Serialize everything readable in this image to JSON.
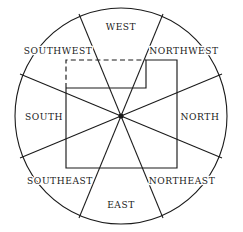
{
  "figure": {
    "background_color": "#ffffff",
    "line_color": "#1a1a1a"
  },
  "compass": {
    "center": {
      "x": 121,
      "y": 116
    },
    "radius_x": 106,
    "radius_y": 108,
    "sector_count": 8,
    "labels": [
      {
        "name": "west",
        "text": "WEST",
        "x": 121,
        "y": 27,
        "angle_deg": 270
      },
      {
        "name": "northwest",
        "text": "NORTHWEST",
        "x": 184,
        "y": 51,
        "angle_deg": 315
      },
      {
        "name": "north",
        "text": "NORTH",
        "x": 200,
        "y": 117,
        "angle_deg": 0
      },
      {
        "name": "northeast",
        "text": "NORTHEAST",
        "x": 182,
        "y": 181,
        "angle_deg": 45
      },
      {
        "name": "east",
        "text": "EAST",
        "x": 121,
        "y": 205,
        "angle_deg": 90
      },
      {
        "name": "southeast",
        "text": "SOUTHEAST",
        "x": 60,
        "y": 181,
        "angle_deg": 135
      },
      {
        "name": "south",
        "text": "SOUTH",
        "x": 44,
        "y": 117,
        "angle_deg": 180
      },
      {
        "name": "southwest",
        "text": "SOUTHWEST",
        "x": 58,
        "y": 51,
        "angle_deg": 225
      }
    ],
    "spokes": [
      {
        "name": "spoke-1",
        "x1": 121,
        "y1": 116,
        "x2": 79,
        "y2": 14
      },
      {
        "name": "spoke-2",
        "x1": 121,
        "y1": 116,
        "x2": 163,
        "y2": 14
      },
      {
        "name": "spoke-3",
        "x1": 121,
        "y1": 116,
        "x2": 222,
        "y2": 74
      },
      {
        "name": "spoke-4",
        "x1": 121,
        "y1": 116,
        "x2": 222,
        "y2": 158
      },
      {
        "name": "spoke-5",
        "x1": 121,
        "y1": 116,
        "x2": 163,
        "y2": 218
      },
      {
        "name": "spoke-6",
        "x1": 121,
        "y1": 116,
        "x2": 79,
        "y2": 218
      },
      {
        "name": "spoke-7",
        "x1": 121,
        "y1": 116,
        "x2": 20,
        "y2": 158
      },
      {
        "name": "spoke-8",
        "x1": 121,
        "y1": 116,
        "x2": 20,
        "y2": 74
      }
    ]
  },
  "state_outline": {
    "name": "state-boundary",
    "solid_path": "M 66 88 L 146 88 L 146 60 L 177 60 L 177 168 L 66 168 L 66 88",
    "dashed_path": "M 66 88 L 66 60 L 146 60",
    "corners": [
      {
        "x": 66,
        "y": 60
      },
      {
        "x": 146,
        "y": 60
      },
      {
        "x": 146,
        "y": 88
      },
      {
        "x": 66,
        "y": 88
      },
      {
        "x": 177,
        "y": 60
      },
      {
        "x": 177,
        "y": 168
      },
      {
        "x": 66,
        "y": 168
      }
    ]
  },
  "center_marker": {
    "name": "center-point",
    "x": 121,
    "y": 116,
    "radius": 2.6
  }
}
